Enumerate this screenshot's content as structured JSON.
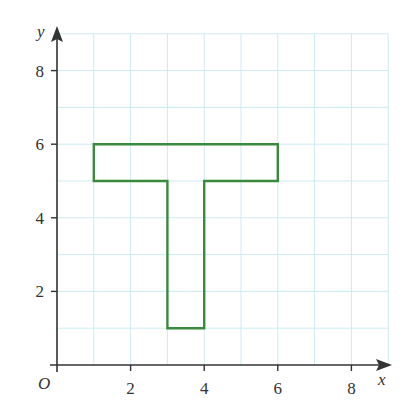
{
  "chart_data": {
    "type": "line",
    "title": "",
    "xlabel": "x",
    "ylabel": "y",
    "origin_label": "O",
    "xlim": [
      0,
      9
    ],
    "ylim": [
      0,
      9
    ],
    "grid": true,
    "grid_step": 1,
    "x_ticks": [
      2,
      4,
      6,
      8
    ],
    "y_ticks": [
      2,
      4,
      6,
      8
    ],
    "x_tick_labels": [
      "2",
      "4",
      "6",
      "8"
    ],
    "y_tick_labels": [
      "2",
      "4",
      "6",
      "8"
    ],
    "series": [
      {
        "name": "T-shape",
        "closed": true,
        "color": "#3a8a3e",
        "points": [
          [
            1,
            6
          ],
          [
            6,
            6
          ],
          [
            6,
            5
          ],
          [
            4,
            5
          ],
          [
            4,
            1
          ],
          [
            3,
            1
          ],
          [
            3,
            5
          ],
          [
            1,
            5
          ]
        ]
      }
    ]
  },
  "colors": {
    "grid": "#cdeaf2",
    "axis": "#333333",
    "shape": "#3a8a3e"
  }
}
